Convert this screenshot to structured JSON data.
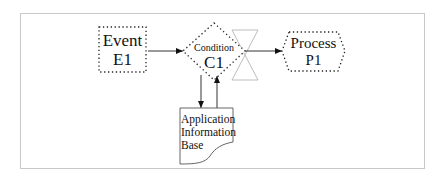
{
  "diagram": {
    "frame": {
      "stroke": "#c8c8c8"
    },
    "nodes": {
      "event": {
        "line1": "Event",
        "line2": "E1",
        "shape": "dotted-rectangle"
      },
      "condition": {
        "line1": "Condition",
        "line2": "C1",
        "shape": "dotted-diamond"
      },
      "gate": {
        "shape": "hourglass",
        "stroke": "#bdbdbd"
      },
      "process": {
        "line1": "Process",
        "line2": "P1",
        "shape": "dotted-hexagon"
      },
      "info_base": {
        "line1": "Application",
        "line2": "Information",
        "line3": "Base",
        "shape": "document"
      }
    },
    "edges": [
      {
        "from": "event",
        "to": "condition"
      },
      {
        "from": "condition",
        "to": "process"
      },
      {
        "from": "condition",
        "to": "info_base"
      },
      {
        "from": "info_base",
        "to": "condition"
      }
    ]
  }
}
